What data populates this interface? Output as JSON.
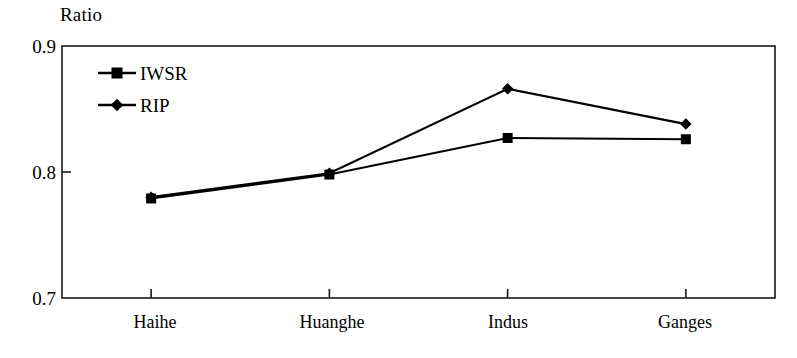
{
  "chart_data": {
    "type": "line",
    "title": "",
    "ylabel": "Ratio",
    "xlabel": "",
    "categories": [
      "Haihe",
      "Huanghe",
      "Indus",
      "Ganges"
    ],
    "ylim": [
      0.7,
      0.9
    ],
    "yticks": [
      "0.7",
      "0.8",
      "0.9"
    ],
    "ytick_values": [
      0.7,
      0.8,
      0.9
    ],
    "grid": false,
    "legend_position": "top-left-inside",
    "series": [
      {
        "name": "IWSR",
        "marker": "square",
        "color": "#000000",
        "values": [
          0.779,
          0.798,
          0.827,
          0.826
        ]
      },
      {
        "name": "RIP",
        "marker": "diamond",
        "color": "#000000",
        "values": [
          0.78,
          0.799,
          0.866,
          0.838
        ]
      }
    ]
  },
  "axis": {
    "y_title": "Ratio",
    "y_tick_0": "0.9",
    "y_tick_1": "0.8",
    "y_tick_2": "0.7",
    "x_tick_0": "Haihe",
    "x_tick_1": "Huanghe",
    "x_tick_2": "Indus",
    "x_tick_3": "Ganges"
  },
  "legend": {
    "item_0_label": "IWSR",
    "item_1_label": "RIP"
  },
  "style": {
    "line_color": "#000000",
    "frame_color": "#1a1a1a",
    "background": "#ffffff"
  }
}
